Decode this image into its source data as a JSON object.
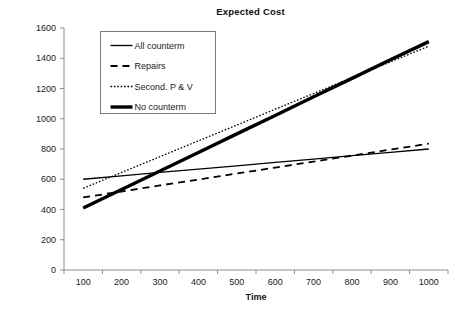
{
  "chart_data": {
    "type": "line",
    "title": "Expected Cost",
    "xlabel": "Time",
    "ylabel": "",
    "x": [
      100,
      200,
      300,
      400,
      500,
      600,
      700,
      800,
      900,
      1000
    ],
    "xtick_labels": [
      "100",
      "200",
      "300",
      "400",
      "500",
      "600",
      "700",
      "800",
      "900",
      "1000"
    ],
    "ytick_labels": [
      "0",
      "200",
      "400",
      "600",
      "800",
      "1000",
      "1200",
      "1400",
      "1600"
    ],
    "ylim": [
      0,
      1600
    ],
    "ytick_step": 200,
    "grid": false,
    "legend_position": "upper-left-inside",
    "series": [
      {
        "name": "All counterm",
        "style": "solid-thin",
        "color": "#000000",
        "values": [
          600,
          622,
          645,
          667,
          689,
          711,
          733,
          756,
          778,
          800
        ]
      },
      {
        "name": "Repairs",
        "style": "dashed",
        "color": "#000000",
        "values": [
          480,
          519,
          559,
          598,
          638,
          677,
          717,
          756,
          796,
          835
        ]
      },
      {
        "name": "Second. P & V",
        "style": "dotted",
        "color": "#000000",
        "values": [
          540,
          645,
          749,
          854,
          958,
          1063,
          1167,
          1272,
          1376,
          1480
        ]
      },
      {
        "name": "No counterm",
        "style": "solid-thick",
        "color": "#000000",
        "values": [
          410,
          532,
          655,
          777,
          900,
          1022,
          1145,
          1267,
          1390,
          1510
        ]
      }
    ]
  },
  "legend": {
    "items": [
      {
        "label": "All counterm"
      },
      {
        "label": "Repairs"
      },
      {
        "label": "Second. P & V"
      },
      {
        "label": "No counterm"
      }
    ]
  }
}
